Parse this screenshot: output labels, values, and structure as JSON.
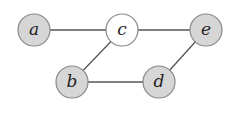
{
  "diagram": {
    "type": "undirected-graph",
    "colors": {
      "default_fill": "#d6d6d6",
      "default_stroke": "#8a8a8a",
      "highlight_fill": "#ffffff",
      "highlight_stroke": "#111111",
      "edge": "#555555"
    },
    "nodes": [
      {
        "id": "a",
        "label": "a",
        "x": 34,
        "y": 30,
        "highlighted": false
      },
      {
        "id": "c",
        "label": "c",
        "x": 122,
        "y": 30,
        "highlighted": true
      },
      {
        "id": "e",
        "label": "e",
        "x": 206,
        "y": 30,
        "highlighted": false
      },
      {
        "id": "b",
        "label": "b",
        "x": 72,
        "y": 82,
        "highlighted": false
      },
      {
        "id": "d",
        "label": "d",
        "x": 159,
        "y": 82,
        "highlighted": false
      }
    ],
    "edges": [
      {
        "from": "a",
        "to": "c"
      },
      {
        "from": "c",
        "to": "e"
      },
      {
        "from": "c",
        "to": "b"
      },
      {
        "from": "b",
        "to": "d"
      },
      {
        "from": "d",
        "to": "e"
      }
    ],
    "node_radius": 16
  }
}
